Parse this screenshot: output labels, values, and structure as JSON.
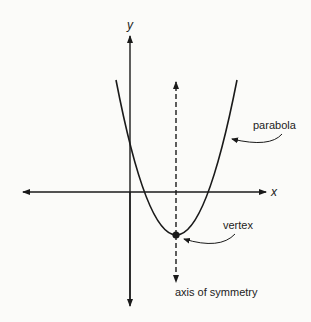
{
  "diagram": {
    "type": "parabola-diagram",
    "axes": {
      "x_label": "x",
      "y_label": "y"
    },
    "labels": {
      "parabola": "parabola",
      "vertex": "vertex",
      "axis_of_symmetry": "axis of symmetry"
    },
    "colors": {
      "line": "#1a1a1a",
      "background": "#fbfbf9"
    }
  }
}
